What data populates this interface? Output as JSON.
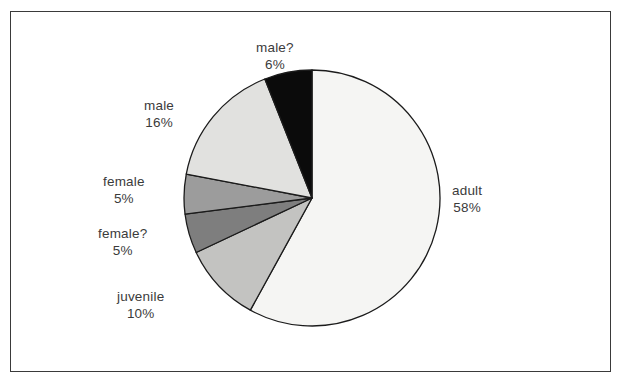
{
  "chart_data": {
    "type": "pie",
    "title": "",
    "subtitle": "",
    "xlabel": "",
    "ylabel": "",
    "legend_position": "none",
    "grid": false,
    "label_format": "name and percent",
    "start_angle_deg": 0,
    "direction": "clockwise",
    "categories": [
      "adult",
      "juvenile",
      "female?",
      "female",
      "male",
      "male?"
    ],
    "values": [
      58,
      10,
      5,
      5,
      16,
      6
    ],
    "slices": [
      {
        "label": "adult",
        "percent_text": "58%",
        "value": 58,
        "color": "#f5f5f3",
        "label_x": 452,
        "label_y": 182
      },
      {
        "label": "juvenile",
        "percent_text": "10%",
        "value": 10,
        "color": "#c3c3c1",
        "label_x": 117,
        "label_y": 288
      },
      {
        "label": "female?",
        "percent_text": "5%",
        "value": 5,
        "color": "#7e7e7e",
        "label_x": 98,
        "label_y": 225
      },
      {
        "label": "female",
        "percent_text": "5%",
        "value": 5,
        "color": "#9c9c9c",
        "label_x": 103,
        "label_y": 173
      },
      {
        "label": "male",
        "percent_text": "16%",
        "value": 16,
        "color": "#e1e1df",
        "label_x": 144,
        "label_y": 97
      },
      {
        "label": "male?",
        "percent_text": "6%",
        "value": 6,
        "color": "#0b0b0b",
        "label_x": 256,
        "label_y": 39
      }
    ],
    "geometry": {
      "center_x": 312,
      "center_y": 198,
      "radius": 128
    },
    "style": {
      "background": "#ffffff",
      "frame_color": "#3a3a3a",
      "slice_outline": "#1b1b1b",
      "label_color": "#3b3b3b"
    }
  }
}
